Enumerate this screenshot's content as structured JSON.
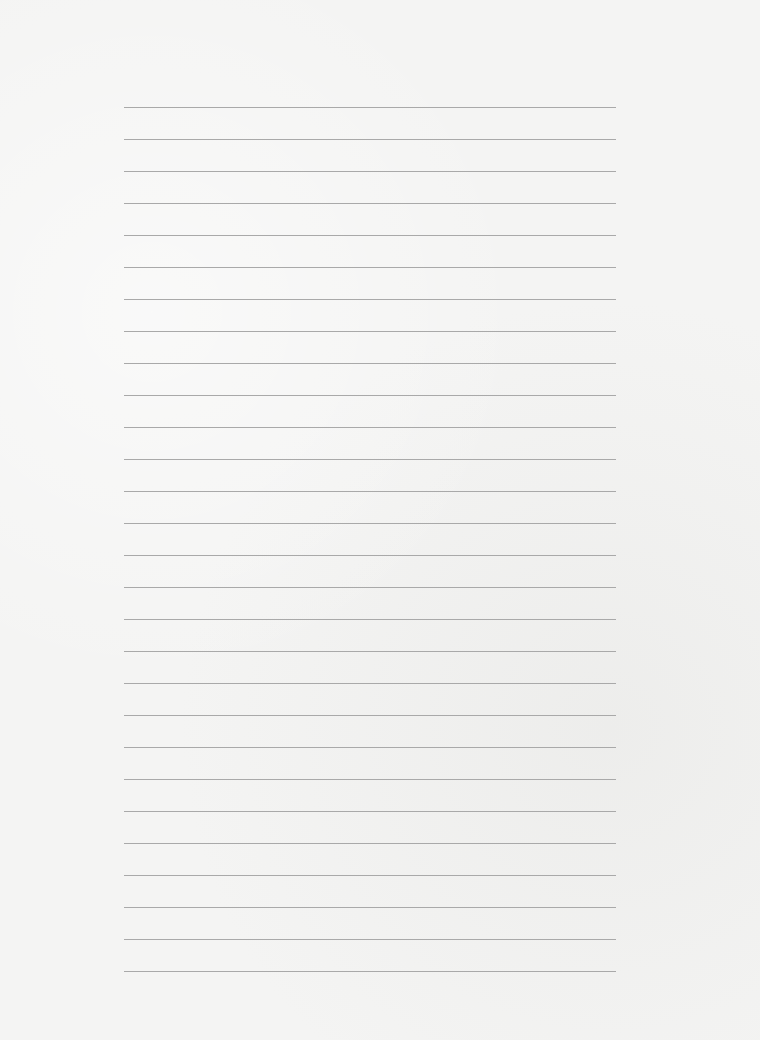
{
  "page": {
    "type": "blank-lined-paper",
    "line_count": 28,
    "first_line_y": 107,
    "line_spacing": 32,
    "line_left": 124,
    "line_width": 492,
    "line_color": "#a9a9a9",
    "paper_color": "#f4f4f3"
  }
}
